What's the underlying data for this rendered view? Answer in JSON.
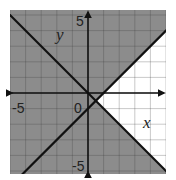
{
  "chart_data": {
    "type": "line",
    "title": "",
    "xlabel": "x",
    "ylabel": "y",
    "xlim": [
      -5,
      5
    ],
    "ylim": [
      -5.2,
      5.3
    ],
    "grid": true,
    "grid_step": 1,
    "tick_labels": {
      "x": [
        "-5",
        "0"
      ],
      "y": [
        "5",
        "-5"
      ]
    },
    "origin_label": "0",
    "series": [
      {
        "name": "boundary-1",
        "equation": "y = -x",
        "slope": -1,
        "intercept": 0,
        "style": "solid"
      },
      {
        "name": "boundary-2",
        "equation": "y = x - 1",
        "slope": 1,
        "intercept": -1,
        "style": "solid"
      }
    ],
    "shading": {
      "description": "Shaded everywhere except the region right of both lines (y > -x and y < x - 1 is unshaded)",
      "unshaded_region": "y > -x and y < x - 1",
      "shade_color": "#8c8c8c",
      "unshaded_color": "#ffffff"
    }
  },
  "labels": {
    "x_axis": "x",
    "y_axis": "y",
    "x_neg": "-5",
    "y_pos": "5",
    "y_neg": "-5",
    "origin": "0"
  },
  "colors": {
    "shade": "#8c8c8c",
    "grid_on_shade": "#7a7a7a",
    "grid_on_white": "#c8c8c8",
    "line": "#111111"
  }
}
